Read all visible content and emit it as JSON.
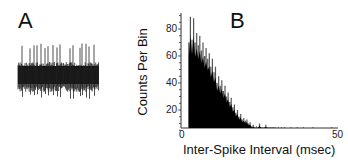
{
  "panels": {
    "a": {
      "label": "A",
      "description": "Extracellular voltage trace with spikes"
    },
    "b": {
      "label": "B"
    }
  },
  "chart_data": [
    {
      "panel": "A",
      "type": "line",
      "title": "",
      "xlabel": "",
      "ylabel": "",
      "description": "Raw recording trace: dense noise band with ~17 upward spike deflections",
      "spike_count_visible": 17
    },
    {
      "panel": "B",
      "type": "bar",
      "title": "B",
      "xlabel": "Inter-Spike Interval (msec)",
      "ylabel": "Counts Per Bin",
      "xlim": [
        0,
        50
      ],
      "ylim": [
        0,
        95
      ],
      "xticks": [
        0,
        50
      ],
      "yticks": [
        20,
        40,
        60,
        80
      ],
      "grid": false,
      "x": [
        2.5,
        3,
        3.5,
        4,
        4.5,
        5,
        5.5,
        6,
        6.5,
        7,
        7.5,
        8,
        8.5,
        9,
        9.5,
        10,
        10.5,
        11,
        11.5,
        12,
        12.5,
        13,
        13.5,
        14,
        14.5,
        15,
        15.5,
        16,
        16.5,
        17,
        17.5,
        18,
        18.5,
        19,
        19.5,
        20,
        20.5,
        21,
        21.5,
        22,
        22.5,
        23,
        23.5,
        24,
        24.5,
        25,
        25.5,
        26,
        26.5,
        27,
        27.5,
        28,
        28.5,
        29,
        29.5,
        30,
        31,
        32,
        33,
        34,
        35,
        36,
        37,
        38,
        39,
        40,
        42,
        44,
        46,
        48,
        50
      ],
      "values": [
        70,
        89,
        72,
        88,
        70,
        77,
        68,
        75,
        64,
        70,
        60,
        66,
        58,
        62,
        52,
        58,
        48,
        52,
        40,
        45,
        38,
        42,
        34,
        38,
        30,
        33,
        26,
        29,
        22,
        24,
        18,
        20,
        15,
        17,
        13,
        14,
        12,
        13,
        10,
        11,
        8,
        9,
        7,
        8,
        5,
        10,
        4,
        5,
        4,
        9,
        3,
        3,
        2,
        2,
        2,
        1,
        1,
        1,
        1,
        0,
        1,
        0,
        1,
        0,
        1,
        0,
        1,
        0,
        0,
        1,
        0
      ]
    }
  ]
}
